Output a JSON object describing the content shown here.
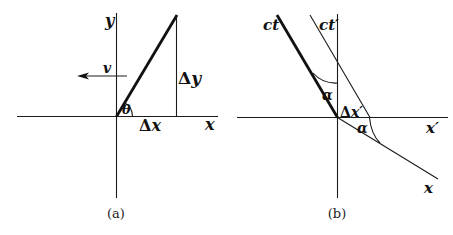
{
  "figure_a": {
    "caption": "(a)",
    "labels": {
      "y_axis": "y",
      "x_axis": "x",
      "velocity": "v",
      "delta_y_symbol": "Δ",
      "delta_y_var": "y",
      "delta_x_symbol": "Δ",
      "delta_x_var": "x",
      "angle": "θ"
    }
  },
  "figure_b": {
    "caption": "(b)",
    "labels": {
      "ct_axis": "ct",
      "ct_prime_axis": "ct′",
      "x_axis": "x",
      "x_prime_axis": "x′",
      "angle_upper": "α",
      "angle_lower": "α",
      "delta_x_prime_symbol": "Δ",
      "delta_x_prime_var": "x′"
    }
  }
}
